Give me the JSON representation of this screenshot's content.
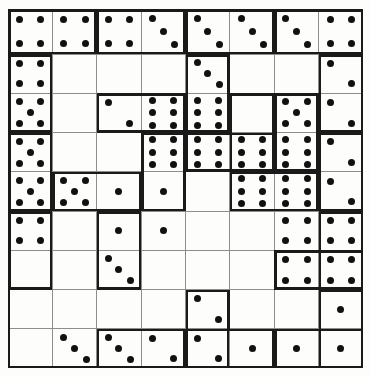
{
  "puzzle": {
    "title": "domino-grid-puzzle",
    "type": "domino-tiling",
    "columns": 8,
    "rows": 8,
    "pip_color": "#111111",
    "line_color": "#1a1a1a",
    "separator_color": "#8d8d8d",
    "background_color": "#fdfdfc"
  },
  "chart_data": {
    "type": "table",
    "columns": 8,
    "rows": 8,
    "grid_values": [
      [
        4,
        4,
        4,
        4,
        3,
        3,
        3,
        3,
        5
      ],
      [
        4,
        0,
        0,
        0,
        3,
        0,
        0,
        0,
        2
      ],
      [
        5,
        0,
        2,
        4,
        3,
        0,
        3,
        0,
        2
      ],
      [
        5,
        0,
        0,
        3,
        4,
        4,
        3,
        0,
        2
      ],
      [
        5,
        5,
        1,
        1,
        0,
        6,
        6,
        1,
        2
      ],
      [
        4,
        0,
        1,
        1,
        0,
        0,
        4,
        0,
        4
      ],
      [
        0,
        0,
        3,
        0,
        0,
        0,
        4,
        0,
        4
      ],
      [
        0,
        0,
        0,
        0,
        2,
        0,
        0,
        0,
        1
      ],
      [
        0,
        3,
        3,
        2,
        2,
        1,
        1,
        1,
        1
      ]
    ]
  },
  "cells": [
    {
      "c": 0,
      "r": 0,
      "v": 4
    },
    {
      "c": 1,
      "r": 0,
      "v": 4
    },
    {
      "c": 2,
      "r": 0,
      "v": 4
    },
    {
      "c": 3,
      "r": 0,
      "v": 3
    },
    {
      "c": 4,
      "r": 0,
      "v": 3
    },
    {
      "c": 5,
      "r": 0,
      "v": 3
    },
    {
      "c": 6,
      "r": 0,
      "v": 3
    },
    {
      "c": 7,
      "r": 0,
      "v": 4
    },
    {
      "c": 0,
      "r": 1,
      "v": 4
    },
    {
      "c": 1,
      "r": 1,
      "v": 0
    },
    {
      "c": 2,
      "r": 1,
      "v": 0
    },
    {
      "c": 3,
      "r": 1,
      "v": 0
    },
    {
      "c": 4,
      "r": 1,
      "v": 3
    },
    {
      "c": 5,
      "r": 1,
      "v": 0
    },
    {
      "c": 6,
      "r": 1,
      "v": 0
    },
    {
      "c": 7,
      "r": 1,
      "v": 2
    },
    {
      "c": 0,
      "r": 2,
      "v": 5
    },
    {
      "c": 1,
      "r": 2,
      "v": 0
    },
    {
      "c": 2,
      "r": 2,
      "v": 2
    },
    {
      "c": 3,
      "r": 2,
      "v": 6
    },
    {
      "c": 4,
      "r": 2,
      "v": 6
    },
    {
      "c": 5,
      "r": 2,
      "v": 0
    },
    {
      "c": 6,
      "r": 2,
      "v": 5
    },
    {
      "c": 7,
      "r": 2,
      "v": 2
    },
    {
      "c": 0,
      "r": 3,
      "v": 5
    },
    {
      "c": 1,
      "r": 3,
      "v": 0
    },
    {
      "c": 2,
      "r": 3,
      "v": 0
    },
    {
      "c": 3,
      "r": 3,
      "v": 6
    },
    {
      "c": 4,
      "r": 3,
      "v": 6
    },
    {
      "c": 5,
      "r": 3,
      "v": 6
    },
    {
      "c": 6,
      "r": 3,
      "v": 6
    },
    {
      "c": 7,
      "r": 3,
      "v": 2
    },
    {
      "c": 0,
      "r": 4,
      "v": 5
    },
    {
      "c": 1,
      "r": 4,
      "v": 5
    },
    {
      "c": 2,
      "r": 4,
      "v": 1
    },
    {
      "c": 3,
      "r": 4,
      "v": 1
    },
    {
      "c": 4,
      "r": 4,
      "v": 0
    },
    {
      "c": 5,
      "r": 4,
      "v": 6
    },
    {
      "c": 6,
      "r": 4,
      "v": 6
    },
    {
      "c": 7,
      "r": 4,
      "v": 2
    },
    {
      "c": 0,
      "r": 5,
      "v": 4
    },
    {
      "c": 1,
      "r": 5,
      "v": 0
    },
    {
      "c": 2,
      "r": 5,
      "v": 1
    },
    {
      "c": 3,
      "r": 5,
      "v": 1
    },
    {
      "c": 4,
      "r": 5,
      "v": 0
    },
    {
      "c": 5,
      "r": 5,
      "v": 0
    },
    {
      "c": 6,
      "r": 5,
      "v": 4
    },
    {
      "c": 7,
      "r": 5,
      "v": 4
    },
    {
      "c": 0,
      "r": 6,
      "v": 0
    },
    {
      "c": 1,
      "r": 6,
      "v": 0
    },
    {
      "c": 2,
      "r": 6,
      "v": 3
    },
    {
      "c": 3,
      "r": 6,
      "v": 0
    },
    {
      "c": 4,
      "r": 6,
      "v": 0
    },
    {
      "c": 5,
      "r": 6,
      "v": 0
    },
    {
      "c": 6,
      "r": 6,
      "v": 4
    },
    {
      "c": 7,
      "r": 6,
      "v": 4
    },
    {
      "c": 0,
      "r": 7,
      "v": 0
    },
    {
      "c": 1,
      "r": 7,
      "v": 0
    },
    {
      "c": 2,
      "r": 7,
      "v": 0
    },
    {
      "c": 3,
      "r": 7,
      "v": 0
    },
    {
      "c": 4,
      "r": 7,
      "v": 2
    },
    {
      "c": 5,
      "r": 7,
      "v": 0
    },
    {
      "c": 6,
      "r": 7,
      "v": 0
    },
    {
      "c": 7,
      "r": 7,
      "v": 1
    },
    {
      "c": 0,
      "r": 8,
      "v": 0
    },
    {
      "c": 1,
      "r": 8,
      "v": 3
    },
    {
      "c": 2,
      "r": 8,
      "v": 3
    },
    {
      "c": 3,
      "r": 8,
      "v": 2
    },
    {
      "c": 4,
      "r": 8,
      "v": 2
    },
    {
      "c": 5,
      "r": 8,
      "v": 1
    },
    {
      "c": 6,
      "r": 8,
      "v": 1
    },
    {
      "c": 7,
      "r": 8,
      "v": 1
    }
  ],
  "dominoes": [
    {
      "c": 0,
      "r": 0,
      "orient": "h"
    },
    {
      "c": 2,
      "r": 0,
      "orient": "h"
    },
    {
      "c": 4,
      "r": 0,
      "orient": "h"
    },
    {
      "c": 6,
      "r": 0,
      "orient": "h"
    },
    {
      "c": 0,
      "r": 1,
      "orient": "v"
    },
    {
      "c": 4,
      "r": 1,
      "orient": "v"
    },
    {
      "c": 7,
      "r": 1,
      "orient": "v"
    },
    {
      "c": 2,
      "r": 2,
      "orient": "h"
    },
    {
      "c": 5,
      "r": 2,
      "orient": "v"
    },
    {
      "c": 6,
      "r": 2,
      "orient": "v"
    },
    {
      "c": 0,
      "r": 3,
      "orient": "v"
    },
    {
      "c": 3,
      "r": 3,
      "orient": "v"
    },
    {
      "c": 7,
      "r": 3,
      "orient": "v"
    },
    {
      "c": 4,
      "r": 3,
      "orient": "h"
    },
    {
      "c": 1,
      "r": 4,
      "orient": "h"
    },
    {
      "c": 5,
      "r": 4,
      "orient": "h"
    },
    {
      "c": 0,
      "r": 5,
      "orient": "v"
    },
    {
      "c": 2,
      "r": 5,
      "orient": "v"
    },
    {
      "c": 7,
      "r": 5,
      "orient": "v"
    },
    {
      "c": 6,
      "r": 6,
      "orient": "h"
    },
    {
      "c": 4,
      "r": 7,
      "orient": "v"
    },
    {
      "c": 7,
      "r": 7,
      "orient": "v"
    },
    {
      "c": 2,
      "r": 8,
      "orient": "h"
    },
    {
      "c": 4,
      "r": 8,
      "orient": "h"
    },
    {
      "c": 6,
      "r": 8,
      "orient": "h"
    }
  ]
}
